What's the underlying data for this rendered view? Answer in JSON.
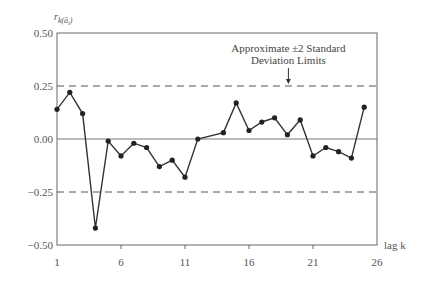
{
  "chart_data": {
    "type": "line",
    "title": "",
    "xlabel": "lag k",
    "ylabel": "r_k(â_t)",
    "ylabel_display": {
      "base": "r",
      "sub": "k(â",
      "subsub": "t",
      "close": ")"
    },
    "xlim": [
      1,
      26
    ],
    "ylim": [
      -0.5,
      0.5
    ],
    "x_ticks": [
      1,
      6,
      11,
      16,
      21,
      26
    ],
    "x_tick_labels": [
      "1",
      "6",
      "11",
      "16",
      "21",
      "26"
    ],
    "y_ticks": [
      0.5,
      0.25,
      0.0,
      -0.25,
      -0.5
    ],
    "y_tick_labels": [
      "0.50",
      "0.25",
      "0.00",
      "−0.25",
      "−0.50"
    ],
    "grid": false,
    "reference_lines": [
      {
        "y": 0.0,
        "style": "solid"
      },
      {
        "y": 0.25,
        "style": "dashed"
      },
      {
        "y": -0.25,
        "style": "dashed"
      }
    ],
    "annotation": {
      "line1": "Approximate ±2 Standard",
      "line2": "Deviation Limits",
      "arrow_target_y": 0.25,
      "arrow_x_lag": 19
    },
    "series": [
      {
        "name": "residual autocorrelation",
        "x": [
          1,
          2,
          3,
          4,
          5,
          6,
          7,
          8,
          9,
          10,
          11,
          12,
          14,
          15,
          16,
          17,
          18,
          19,
          20,
          21,
          22,
          23,
          24,
          25
        ],
        "values": [
          0.14,
          0.22,
          0.12,
          -0.42,
          -0.01,
          -0.08,
          -0.02,
          -0.04,
          -0.13,
          -0.1,
          -0.18,
          0.0,
          0.03,
          0.17,
          0.04,
          0.08,
          0.1,
          0.02,
          0.09,
          -0.08,
          -0.04,
          -0.06,
          -0.09,
          0.15
        ]
      }
    ]
  }
}
